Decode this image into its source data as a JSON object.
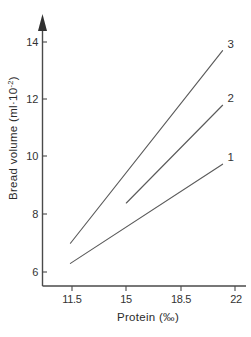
{
  "chart_data": {
    "type": "line",
    "title": "",
    "xlabel": "Protein (‰)",
    "ylabel": "Bread volume (ml·10⁻²)",
    "ylabel_main": "Bread volume (ml·10",
    "ylabel_sup": "-2",
    "ylabel_tail": ")",
    "xlabel_main": "Protein (",
    "xlabel_sup": "‰",
    "xlabel_tail": ")",
    "xlim": [
      10.3,
      23.2
    ],
    "ylim": [
      5.3,
      14.8
    ],
    "xticks": [
      11.5,
      15,
      18.5,
      22
    ],
    "xtick_labels": [
      "11.5",
      "15",
      "18.5",
      "22"
    ],
    "yticks": [
      6,
      8,
      10,
      12,
      14
    ],
    "ytick_labels": [
      "6",
      "8",
      "10",
      "12",
      "14"
    ],
    "grid": false,
    "legend": "inline-right-end-labels",
    "y_axis_arrow": true,
    "series": [
      {
        "name": "1",
        "label": "1",
        "x": [
          11.4,
          21.2
        ],
        "values": [
          6.3,
          9.75
        ]
      },
      {
        "name": "2",
        "label": "2",
        "x": [
          15.0,
          21.2
        ],
        "values": [
          8.4,
          11.8
        ]
      },
      {
        "name": "3",
        "label": "3",
        "x": [
          11.4,
          21.2
        ],
        "values": [
          7.0,
          13.7
        ]
      }
    ]
  },
  "caption": {
    "text": ""
  }
}
